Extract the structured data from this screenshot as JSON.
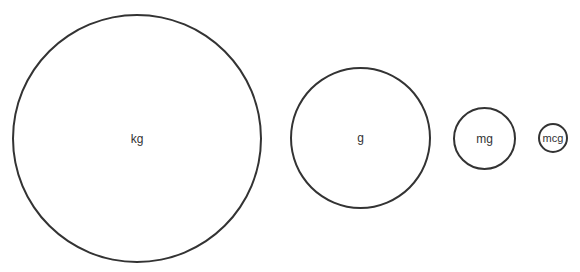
{
  "diagram": {
    "type": "proportional-circles",
    "stroke_color": "#333333",
    "background_color": "#ffffff",
    "circles": [
      {
        "label": "kg",
        "center": [
          137,
          138
        ],
        "radius": 124
      },
      {
        "label": "g",
        "center": [
          360,
          138
        ],
        "radius": 70
      },
      {
        "label": "mg",
        "center": [
          484,
          138
        ],
        "radius": 31
      },
      {
        "label": "mcg",
        "center": [
          553,
          138
        ],
        "radius": 15
      }
    ]
  }
}
